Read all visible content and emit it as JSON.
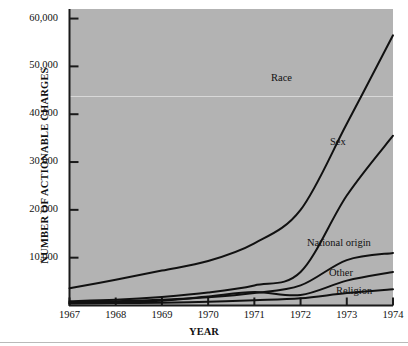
{
  "figure": {
    "background_color": "#ffffff",
    "plot_background_color": "#b3b3b3",
    "axis_color": "#1a1a1a",
    "line_color": "#111111"
  },
  "axes": {
    "y_title": "NUMBER OF ACTIONABLE CHARGES",
    "x_title": "YEAR",
    "y_ticklabels": [
      "60,000",
      "50,000",
      "40,000",
      "30,000",
      "20,000",
      "10,000"
    ],
    "x_ticklabels": [
      "1967",
      "1968",
      "1969",
      "1970",
      "1971",
      "1972",
      "1973",
      "1974"
    ]
  },
  "series_labels": {
    "race": "Race",
    "sex": "Sex",
    "national_origin": "National origin",
    "other": "Other",
    "religion": "Religion"
  },
  "chart_data": {
    "type": "line",
    "title": "",
    "xlabel": "YEAR",
    "ylabel": "NUMBER OF ACTIONABLE CHARGES",
    "x": [
      1967,
      1968,
      1969,
      1970,
      1971,
      1972,
      1973,
      1974
    ],
    "xlim": [
      1967,
      1974
    ],
    "ylim": [
      0,
      62000
    ],
    "yticks": [
      10000,
      20000,
      30000,
      40000,
      50000,
      60000
    ],
    "xticks": [
      1967,
      1968,
      1969,
      1970,
      1971,
      1972,
      1973,
      1974
    ],
    "grid": false,
    "legend": "inline-curve-labels",
    "series": [
      {
        "name": "Race",
        "values": [
          3600,
          5400,
          7300,
          9300,
          13000,
          20000,
          38000,
          56500
        ]
      },
      {
        "name": "Sex",
        "values": [
          900,
          1200,
          1800,
          2700,
          4200,
          7000,
          23000,
          35500
        ]
      },
      {
        "name": "National origin",
        "values": [
          700,
          900,
          1200,
          1700,
          2600,
          4200,
          9500,
          11000
        ]
      },
      {
        "name": "Other",
        "values": [
          500,
          700,
          1000,
          1900,
          2800,
          2200,
          5200,
          7000
        ]
      },
      {
        "name": "Religion",
        "values": [
          400,
          500,
          600,
          800,
          1100,
          1500,
          2600,
          3400
        ]
      }
    ]
  }
}
